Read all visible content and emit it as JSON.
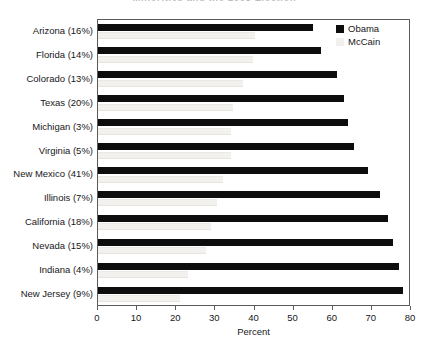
{
  "chart_data": {
    "type": "bar",
    "orientation": "horizontal",
    "title": "Minorities and the 2008 Election",
    "xlabel": "Percent",
    "ylabel": "",
    "xlim": [
      0,
      80
    ],
    "xticks": [
      0,
      10,
      20,
      30,
      40,
      50,
      60,
      70,
      80
    ],
    "xtick_labels": [
      "0",
      "10",
      "20",
      "30",
      "40",
      "50",
      "60",
      "70",
      "80"
    ],
    "grid": false,
    "legend_position": "top-right",
    "categories": [
      "Arizona (16%)",
      "Florida (14%)",
      "Colorado (13%)",
      "Texas (20%)",
      "Michigan (3%)",
      "Virginia (5%)",
      "New Mexico (41%)",
      "Illinois (7%)",
      "California (18%)",
      "Nevada (15%)",
      "Indiana (4%)",
      "New Jersey (9%)"
    ],
    "series": [
      {
        "name": "Obama",
        "color": "#0d0d0d",
        "values": [
          55,
          57,
          61,
          63,
          64,
          65.5,
          69,
          72,
          74,
          75.5,
          77,
          78
        ]
      },
      {
        "name": "McCain",
        "color": "#f1f0ed",
        "values": [
          40,
          39.5,
          37,
          34.5,
          34,
          34,
          32,
          30.5,
          29,
          27.5,
          23,
          21
        ]
      }
    ]
  },
  "legend": {
    "entries": [
      {
        "label": "Obama"
      },
      {
        "label": "McCain"
      }
    ]
  }
}
